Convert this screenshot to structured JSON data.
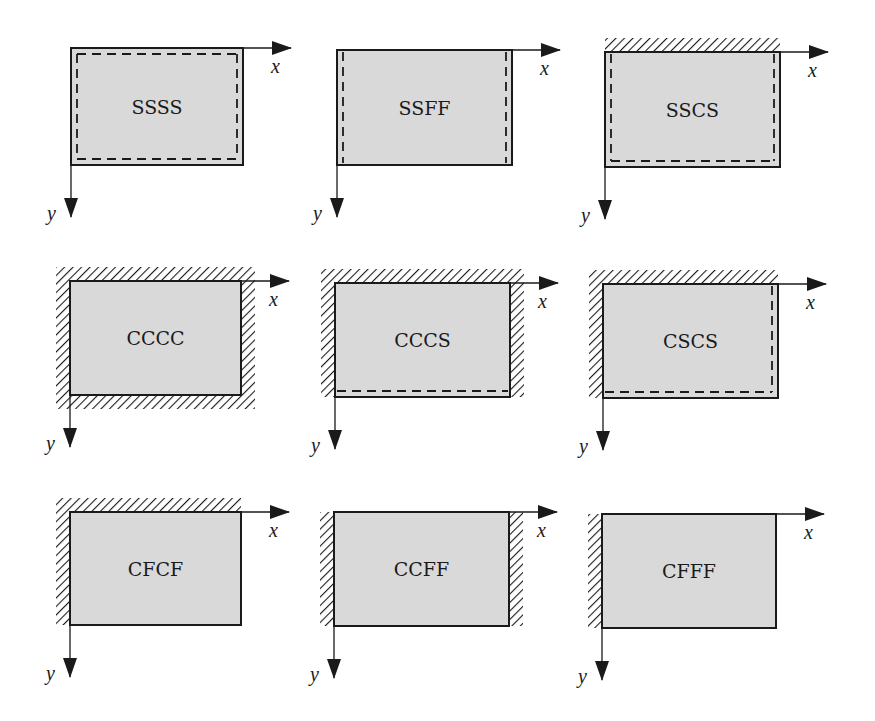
{
  "figure": {
    "colors": {
      "plate_fill": "#d9d9d9",
      "edge": "#1a1a1a",
      "hatch": "#1a1a1a",
      "background": "#ffffff"
    },
    "legend_of_edges": {
      "S": "simply supported (dashed line)",
      "C": "clamped (hatched)",
      "F": "free (plain edge)"
    },
    "axes": {
      "x_label": "x",
      "y_label": "y"
    },
    "panels": [
      {
        "label": "SSSS",
        "row": 1,
        "col": 1,
        "plate": [
          71,
          48,
          172,
          117
        ],
        "edges": {
          "top": "S",
          "right": "S",
          "bottom": "S",
          "left": "S"
        }
      },
      {
        "label": "SSFF",
        "row": 1,
        "col": 2,
        "plate": [
          337,
          50,
          175,
          115
        ],
        "edges": {
          "top": "F",
          "right": "S",
          "bottom": "F",
          "left": "S"
        }
      },
      {
        "label": "SSCS",
        "row": 1,
        "col": 3,
        "plate": [
          605,
          52,
          175,
          115
        ],
        "edges": {
          "top": "C",
          "right": "S",
          "bottom": "S",
          "left": "S"
        }
      },
      {
        "label": "CCCC",
        "row": 2,
        "col": 1,
        "plate": [
          70,
          281,
          171,
          114
        ],
        "edges": {
          "top": "C",
          "right": "C",
          "bottom": "C",
          "left": "C"
        }
      },
      {
        "label": "CCCS",
        "row": 2,
        "col": 2,
        "plate": [
          335,
          283,
          175,
          114
        ],
        "edges": {
          "top": "C",
          "right": "C",
          "bottom": "S",
          "left": "C"
        }
      },
      {
        "label": "CSCS",
        "row": 2,
        "col": 3,
        "plate": [
          603,
          284,
          175,
          114
        ],
        "edges": {
          "top": "C",
          "right": "S",
          "bottom": "S",
          "left": "C"
        }
      },
      {
        "label": "CFCF",
        "row": 3,
        "col": 1,
        "plate": [
          70,
          512,
          171,
          113
        ],
        "edges": {
          "top": "C",
          "right": "F",
          "bottom": "F",
          "left": "C"
        }
      },
      {
        "label": "CCFF",
        "row": 3,
        "col": 2,
        "plate": [
          334,
          512,
          175,
          114
        ],
        "edges": {
          "top": "F",
          "right": "C",
          "bottom": "F",
          "left": "C"
        }
      },
      {
        "label": "CFFF",
        "row": 3,
        "col": 3,
        "plate": [
          602,
          514,
          174,
          114
        ],
        "edges": {
          "top": "F",
          "right": "F",
          "bottom": "F",
          "left": "C"
        }
      }
    ]
  }
}
